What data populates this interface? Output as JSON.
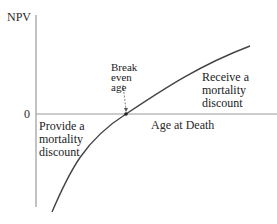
{
  "diagram": {
    "y_axis_label": "NPV",
    "x_axis_label": "Age at Death",
    "zero_label": "0",
    "break_even_label": [
      "Break",
      "even",
      "age"
    ],
    "upper_region_label": [
      "Receive a",
      "mortality",
      "discount"
    ],
    "lower_region_label": [
      "Provide a",
      "mortality",
      "discount"
    ],
    "colors": {
      "axis": "#9a9a9a",
      "curve": "#444444",
      "text": "#2a2a2a"
    }
  }
}
